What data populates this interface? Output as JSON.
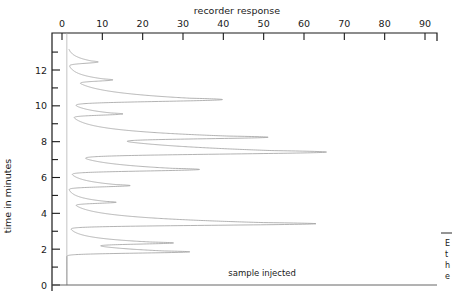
{
  "chart_data": {
    "type": "line",
    "title": "",
    "xlabel": "recorder response",
    "ylabel": "time in minutes",
    "orientation": "horizontal-response-vertical-time",
    "xlim": [
      0,
      93
    ],
    "ylim": [
      -0.4,
      13.2
    ],
    "grid": false,
    "legend": null,
    "x_ticks": [
      0,
      10,
      20,
      30,
      40,
      50,
      60,
      70,
      80,
      90
    ],
    "x_tick_labels": [
      "0",
      "10",
      "20",
      "30",
      "40",
      "50",
      "60",
      "70",
      "80",
      "90"
    ],
    "y_ticks": [
      0,
      1,
      2,
      3,
      4,
      5,
      6,
      7,
      8,
      9,
      10,
      11,
      12,
      13
    ],
    "y_major_ticks": [
      0,
      2,
      4,
      6,
      8,
      10,
      12
    ],
    "y_tick_labels": [
      "0",
      "2",
      "4",
      "6",
      "8",
      "10",
      "12"
    ],
    "baseline_response": 1.2,
    "annotations": [
      {
        "text": "sample injected",
        "x": 58,
        "y": 0.35,
        "anchor": "end"
      }
    ],
    "peaks": [
      {
        "retention_time": 1.85,
        "height": 30.5,
        "width": 0.16
      },
      {
        "retention_time": 2.35,
        "height": 22.5,
        "width": 0.15
      },
      {
        "retention_time": 3.42,
        "height": 61.5,
        "width": 0.2
      },
      {
        "retention_time": 4.62,
        "height": 11.0,
        "width": 0.14
      },
      {
        "retention_time": 5.55,
        "height": 15.5,
        "width": 0.16
      },
      {
        "retention_time": 6.45,
        "height": 32.5,
        "width": 0.2
      },
      {
        "retention_time": 7.42,
        "height": 63.0,
        "width": 0.26
      },
      {
        "retention_time": 8.25,
        "height": 42.0,
        "width": 0.2
      },
      {
        "retention_time": 9.55,
        "height": 13.0,
        "width": 0.16
      },
      {
        "retention_time": 10.35,
        "height": 38.0,
        "width": 0.24
      },
      {
        "retention_time": 11.45,
        "height": 9.5,
        "width": 0.16
      },
      {
        "retention_time": 12.45,
        "height": 7.5,
        "width": 0.17
      }
    ]
  },
  "axes": {
    "x_axis_title": "recorder response",
    "y_axis_title": "time in minutes",
    "x_tick_labels": [
      "0",
      "10",
      "20",
      "30",
      "40",
      "50",
      "60",
      "70",
      "80",
      "90"
    ],
    "y_tick_labels": [
      "12",
      "10",
      "8",
      "6",
      "4",
      "2",
      "0"
    ]
  },
  "annotations": {
    "sample_injected": "sample injected"
  },
  "side_note": {
    "lines": [
      "E",
      "t",
      "h",
      "e"
    ]
  }
}
